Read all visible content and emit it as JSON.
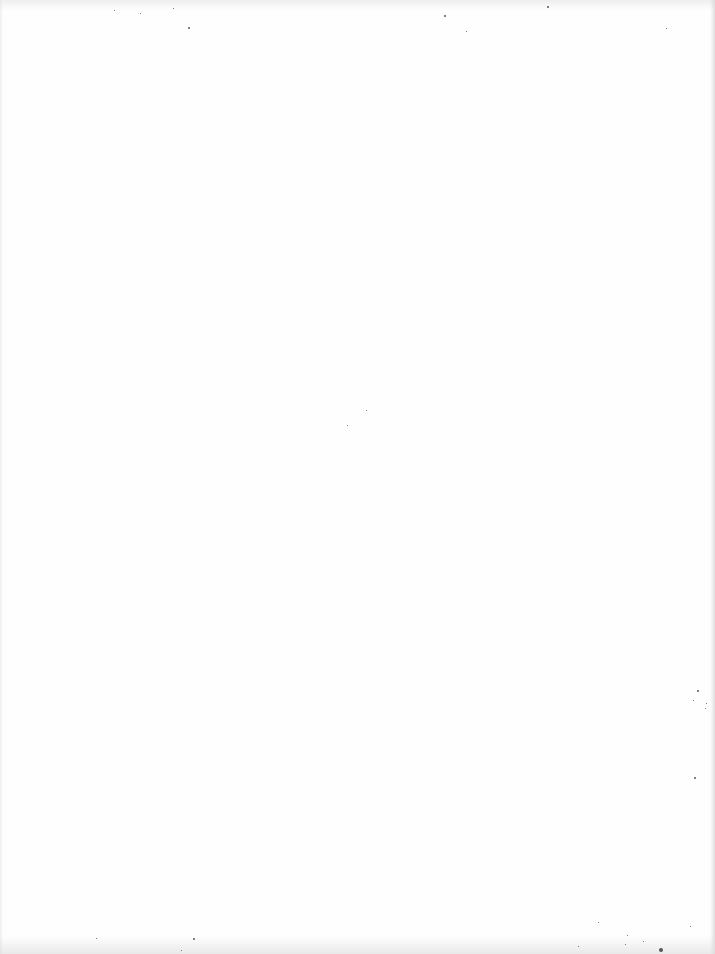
{
  "document": {
    "type": "blank-scanned-page",
    "text": ""
  },
  "specks": [
    {
      "x": 188,
      "y": 27,
      "s": 2
    },
    {
      "x": 444,
      "y": 15,
      "s": 2
    },
    {
      "x": 547,
      "y": 6,
      "s": 2
    },
    {
      "x": 114,
      "y": 10,
      "s": 1
    },
    {
      "x": 140,
      "y": 13,
      "s": 1
    },
    {
      "x": 173,
      "y": 8,
      "s": 1
    },
    {
      "x": 466,
      "y": 31,
      "s": 1
    },
    {
      "x": 666,
      "y": 28,
      "s": 1
    },
    {
      "x": 347,
      "y": 425,
      "s": 1
    },
    {
      "x": 366,
      "y": 410,
      "s": 1
    },
    {
      "x": 697,
      "y": 690,
      "s": 2
    },
    {
      "x": 693,
      "y": 700,
      "s": 1
    },
    {
      "x": 705,
      "y": 708,
      "s": 1
    },
    {
      "x": 694,
      "y": 777,
      "s": 2
    },
    {
      "x": 706,
      "y": 703,
      "s": 1
    },
    {
      "x": 193,
      "y": 938,
      "s": 2
    },
    {
      "x": 96,
      "y": 938,
      "s": 1
    },
    {
      "x": 181,
      "y": 950,
      "s": 1
    },
    {
      "x": 598,
      "y": 922,
      "s": 1
    },
    {
      "x": 627,
      "y": 935,
      "s": 1
    },
    {
      "x": 643,
      "y": 941,
      "s": 1
    },
    {
      "x": 659,
      "y": 948,
      "s": 4
    },
    {
      "x": 625,
      "y": 944,
      "s": 1
    },
    {
      "x": 690,
      "y": 926,
      "s": 1
    },
    {
      "x": 578,
      "y": 946,
      "s": 1
    }
  ]
}
